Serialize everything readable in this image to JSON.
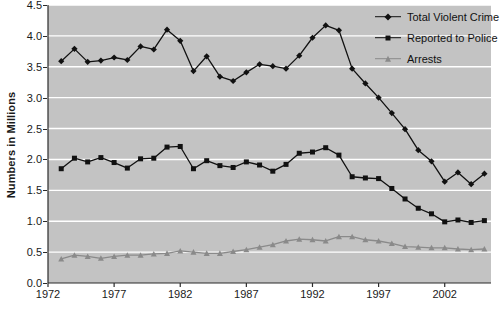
{
  "chart_data": {
    "type": "line",
    "title": "",
    "xlabel": "",
    "ylabel": "Numbers in Millions",
    "xlim": [
      1972,
      2005.5
    ],
    "ylim": [
      0.0,
      4.5
    ],
    "grid": true,
    "grid_axis": "y",
    "legend_position": "top-right",
    "plot_background": "#c3c3c3",
    "gridline_color": "#ffffff",
    "x": [
      1973,
      1974,
      1975,
      1976,
      1977,
      1978,
      1979,
      1980,
      1981,
      1982,
      1983,
      1984,
      1985,
      1986,
      1987,
      1988,
      1989,
      1990,
      1991,
      1992,
      1993,
      1994,
      1995,
      1996,
      1997,
      1998,
      1999,
      2000,
      2001,
      2002,
      2003,
      2004,
      2005
    ],
    "x_ticks": [
      1972,
      1977,
      1982,
      1987,
      1992,
      1997,
      2002
    ],
    "x_tick_labels": [
      "1972",
      "1977",
      "1982",
      "1987",
      "1992",
      "1997",
      "2002"
    ],
    "y_ticks": [
      0.0,
      0.5,
      1.0,
      1.5,
      2.0,
      2.5,
      3.0,
      3.5,
      4.0,
      4.5
    ],
    "y_tick_labels": [
      "0.0",
      "0.5",
      "1.0",
      "1.5",
      "2.0",
      "2.5",
      "3.0",
      "3.5",
      "4.0",
      "4.5"
    ],
    "series": [
      {
        "name": "Total Violent Crime",
        "marker": "diamond",
        "color": "#111111",
        "values": [
          3.59,
          3.79,
          3.58,
          3.6,
          3.65,
          3.61,
          3.83,
          3.78,
          4.1,
          3.92,
          3.43,
          3.67,
          3.34,
          3.27,
          3.41,
          3.54,
          3.51,
          3.47,
          3.68,
          3.97,
          4.17,
          4.09,
          3.47,
          3.23,
          3.0,
          2.75,
          2.49,
          2.15,
          1.97,
          1.64,
          1.79,
          1.6,
          1.77
        ]
      },
      {
        "name": "Reported to Police",
        "marker": "square",
        "color": "#111111",
        "values": [
          1.85,
          2.02,
          1.96,
          2.03,
          1.95,
          1.86,
          2.01,
          2.02,
          2.2,
          2.21,
          1.85,
          1.98,
          1.9,
          1.87,
          1.96,
          1.91,
          1.81,
          1.92,
          2.1,
          2.12,
          2.19,
          2.07,
          1.72,
          1.7,
          1.69,
          1.53,
          1.36,
          1.21,
          1.12,
          0.99,
          1.02,
          0.98,
          1.01
        ]
      },
      {
        "name": "Arrests",
        "marker": "triangle",
        "color": "#8a8a8a",
        "values": [
          0.39,
          0.45,
          0.43,
          0.4,
          0.43,
          0.45,
          0.45,
          0.47,
          0.48,
          0.52,
          0.5,
          0.48,
          0.48,
          0.51,
          0.54,
          0.58,
          0.62,
          0.68,
          0.71,
          0.7,
          0.68,
          0.75,
          0.75,
          0.7,
          0.68,
          0.64,
          0.59,
          0.58,
          0.57,
          0.57,
          0.55,
          0.54,
          0.55
        ]
      }
    ]
  },
  "legend": {
    "items": [
      {
        "label": "Total Violent Crime",
        "marker": "diamond-icon",
        "color": "#111111"
      },
      {
        "label": "Reported to Police",
        "marker": "square-icon",
        "color": "#111111"
      },
      {
        "label": "Arrests",
        "marker": "triangle-icon",
        "color": "#8a8a8a"
      }
    ]
  }
}
